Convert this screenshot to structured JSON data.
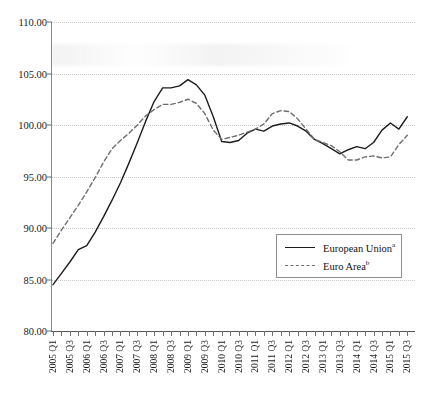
{
  "chart_data": {
    "type": "line",
    "title": "",
    "subtitle": "",
    "xlabel": "",
    "ylabel": "",
    "ylim": [
      80.0,
      110.0
    ],
    "y_ticks": [
      "80.00",
      "85.00",
      "90.00",
      "95.00",
      "100.00",
      "105.00",
      "110.00"
    ],
    "y_tick_values": [
      80,
      85,
      90,
      95,
      100,
      105,
      110
    ],
    "grid": true,
    "grid_style": "dotted-horizontal",
    "legend_position": "lower-right-inside",
    "x": [
      "2005 Q1",
      "2005 Q2",
      "2005 Q3",
      "2005 Q4",
      "2006 Q1",
      "2006 Q2",
      "2006 Q3",
      "2006 Q4",
      "2007 Q1",
      "2007 Q2",
      "2007 Q3",
      "2007 Q4",
      "2008 Q1",
      "2008 Q2",
      "2008 Q3",
      "2008 Q4",
      "2009 Q1",
      "2009 Q2",
      "2009 Q3",
      "2009 Q4",
      "2010 Q1",
      "2010 Q2",
      "2010 Q3",
      "2010 Q4",
      "2011 Q1",
      "2011 Q2",
      "2011 Q3",
      "2011 Q4",
      "2012 Q1",
      "2012 Q2",
      "2012 Q3",
      "2012 Q4",
      "2013 Q1",
      "2013 Q2",
      "2013 Q3",
      "2013 Q4",
      "2014 Q1",
      "2014 Q2",
      "2014 Q3",
      "2014 Q4",
      "2015 Q1",
      "2015 Q2",
      "2015 Q3"
    ],
    "x_tick_labels_shown": [
      "2005 Q1",
      "2005 Q3",
      "2006 Q1",
      "2006 Q3",
      "2007 Q1",
      "2007 Q3",
      "2008 Q1",
      "2008 Q3",
      "2009 Q1",
      "2009 Q3",
      "2010 Q1",
      "2010 Q3",
      "2011 Q1",
      "2011 Q3",
      "2012 Q1",
      "2012 Q3",
      "2013 Q1",
      "2013 Q3",
      "2014 Q1",
      "2014 Q3",
      "2015 Q1",
      "2015 Q3"
    ],
    "series": [
      {
        "name": "European Union",
        "footnote_marker": "a",
        "style": "solid",
        "color": "#1c1c1c",
        "values": [
          84.5,
          85.6,
          86.7,
          87.9,
          88.3,
          89.6,
          91.1,
          92.7,
          94.4,
          96.3,
          98.3,
          100.4,
          102.3,
          103.6,
          103.6,
          103.8,
          104.4,
          103.9,
          102.9,
          100.8,
          98.4,
          98.3,
          98.5,
          99.2,
          99.6,
          99.4,
          99.9,
          100.1,
          100.2,
          99.9,
          99.4,
          98.6,
          98.2,
          97.7,
          97.2,
          97.6,
          97.9,
          97.7,
          98.3,
          99.5,
          100.2,
          99.6,
          100.8
        ]
      },
      {
        "name": "Euro Area",
        "footnote_marker": "b",
        "style": "dashed",
        "color": "#6e6e6e",
        "values": [
          88.5,
          89.8,
          91.0,
          92.2,
          93.5,
          94.9,
          96.4,
          97.7,
          98.5,
          99.2,
          100.0,
          100.9,
          101.5,
          102.0,
          102.0,
          102.2,
          102.5,
          102.1,
          101.1,
          99.5,
          98.6,
          98.8,
          99.0,
          99.3,
          99.6,
          100.1,
          101.1,
          101.4,
          101.3,
          100.6,
          99.6,
          98.6,
          98.3,
          98.0,
          97.4,
          96.6,
          96.6,
          96.9,
          97.0,
          96.8,
          96.9,
          98.1,
          99.0
        ]
      }
    ]
  },
  "legend": {
    "entries": [
      {
        "label": "European Union",
        "marker": "a"
      },
      {
        "label": "Euro Area",
        "marker": "b"
      }
    ]
  }
}
